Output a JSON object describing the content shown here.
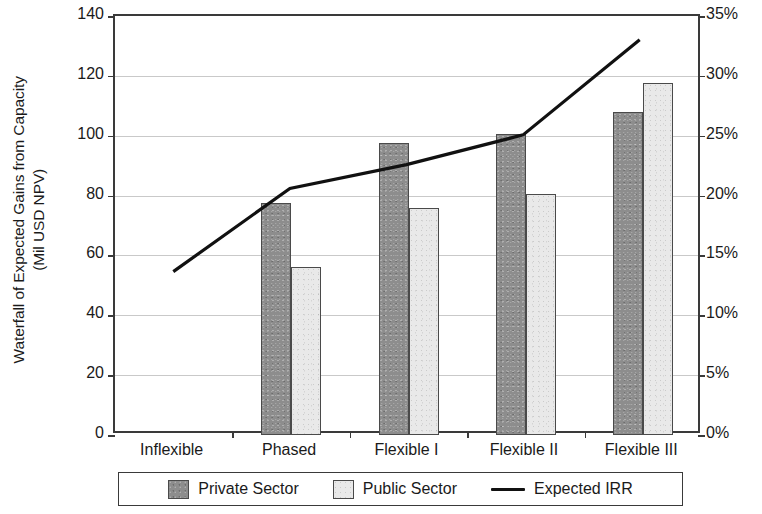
{
  "chart_data": {
    "type": "bar",
    "title": "",
    "subtitle": "",
    "ylabel": "Waterfall of Expected Gains from Capacity (Mil USD NPV)",
    "ylabel_line1": "Waterfall of Expected Gains from Capacity",
    "ylabel_line2": "(Mil USD NPV)",
    "y2label": "",
    "xlabel": "",
    "categories": [
      "Inflexible",
      "Phased",
      "Flexible I",
      "Flexible II",
      "Flexible III"
    ],
    "ylim": [
      0,
      140
    ],
    "y2lim": [
      0,
      35
    ],
    "yticks": [
      0,
      20,
      40,
      60,
      80,
      100,
      120,
      140
    ],
    "ytick_labels": [
      "0",
      "20",
      "40",
      "60",
      "80",
      "100",
      "120",
      "140"
    ],
    "y2ticks": [
      0,
      5,
      10,
      15,
      20,
      25,
      30,
      35
    ],
    "y2tick_labels": [
      "0%",
      "5%",
      "10%",
      "15%",
      "20%",
      "25%",
      "30%",
      "35%"
    ],
    "grid": true,
    "grid_axis": "y",
    "legend_position": "bottom",
    "series": [
      {
        "name": "Private Sector",
        "kind": "bar",
        "axis": "left",
        "color": "#8d8d8d",
        "values": [
          null,
          77.5,
          97.5,
          100.5,
          108
        ]
      },
      {
        "name": "Public Sector",
        "kind": "bar",
        "axis": "left",
        "color": "#e9e9e9",
        "values": [
          null,
          56,
          76,
          80.5,
          117.5
        ]
      },
      {
        "name": "Expected IRR",
        "kind": "line",
        "axis": "right",
        "color": "#111111",
        "values": [
          13.5,
          20.5,
          22.5,
          25.0,
          33.0
        ]
      }
    ]
  },
  "legend": {
    "items": [
      {
        "label": "Private Sector",
        "marker": "swatch-dark"
      },
      {
        "label": "Public Sector",
        "marker": "swatch-light"
      },
      {
        "label": "Expected IRR",
        "marker": "line"
      }
    ]
  },
  "colors": {
    "private_sector": "#8d8d8d",
    "public_sector": "#e9e9e9",
    "irr_line": "#111111",
    "axis": "#3a3a3a",
    "gridline": "#c9c9c9",
    "background": "#ffffff"
  }
}
